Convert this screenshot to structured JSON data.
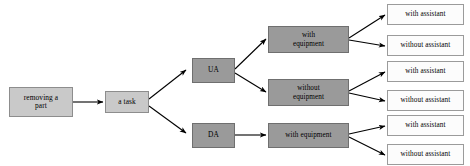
{
  "diagram": {
    "type": "tree-flowchart",
    "colors": {
      "light_node_fill": "#c9c9c9",
      "dark_node_fill": "#9a9a9a",
      "leaf_node_fill": "#fcfcfc",
      "node_border": "#8d8d8d",
      "leaf_border": "#9b9b9b",
      "edge_color": "#000000",
      "background": "#ffffff"
    },
    "nodes": {
      "root": {
        "label": "removing a\npart"
      },
      "task": {
        "label": "a task"
      },
      "branch_ua": {
        "label": "UA"
      },
      "branch_da": {
        "label": "DA"
      },
      "equipment": [
        {
          "label": "with\nequipment"
        },
        {
          "label": "without\nequipment"
        },
        {
          "label": "with equipment"
        }
      ],
      "leaves": [
        {
          "label": "with assistant"
        },
        {
          "label": "without  assistant"
        },
        {
          "label": "with assistant"
        },
        {
          "label": "without  assistant"
        },
        {
          "label": "with  assistant"
        },
        {
          "label": "without  assistant"
        }
      ]
    },
    "edges": [
      {
        "from": "root",
        "to": "task"
      },
      {
        "from": "task",
        "to": "branch_ua"
      },
      {
        "from": "task",
        "to": "branch_da"
      },
      {
        "from": "branch_ua",
        "to": "equipment.0"
      },
      {
        "from": "branch_ua",
        "to": "equipment.1"
      },
      {
        "from": "branch_da",
        "to": "equipment.2"
      },
      {
        "from": "equipment.0",
        "to": "leaves.0"
      },
      {
        "from": "equipment.0",
        "to": "leaves.1"
      },
      {
        "from": "equipment.1",
        "to": "leaves.2"
      },
      {
        "from": "equipment.1",
        "to": "leaves.3"
      },
      {
        "from": "equipment.2",
        "to": "leaves.4"
      },
      {
        "from": "equipment.2",
        "to": "leaves.5"
      }
    ]
  }
}
